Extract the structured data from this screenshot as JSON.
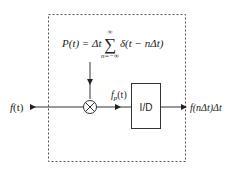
{
  "diagram": {
    "type": "signal-sampling-block-diagram",
    "input": {
      "label_fn": "f",
      "label_arg": "(t)"
    },
    "pulse_train": {
      "lhs": "P(t) = ",
      "delta_t": "Δt",
      "sum_symbol": "∑",
      "sum_upper": "∞",
      "sum_lower": "n=−∞",
      "term": "δ(t − nΔt)"
    },
    "multiplier": {
      "symbol": "⊗"
    },
    "intermediate": {
      "label_fn": "f",
      "label_sub": "p",
      "label_arg": "(t)"
    },
    "block": {
      "label": "I/D"
    },
    "output": {
      "label": "f(nΔt)Δt"
    },
    "colors": {
      "line": "#333333",
      "dashed_border": "#555555",
      "background": "#ffffff"
    }
  }
}
